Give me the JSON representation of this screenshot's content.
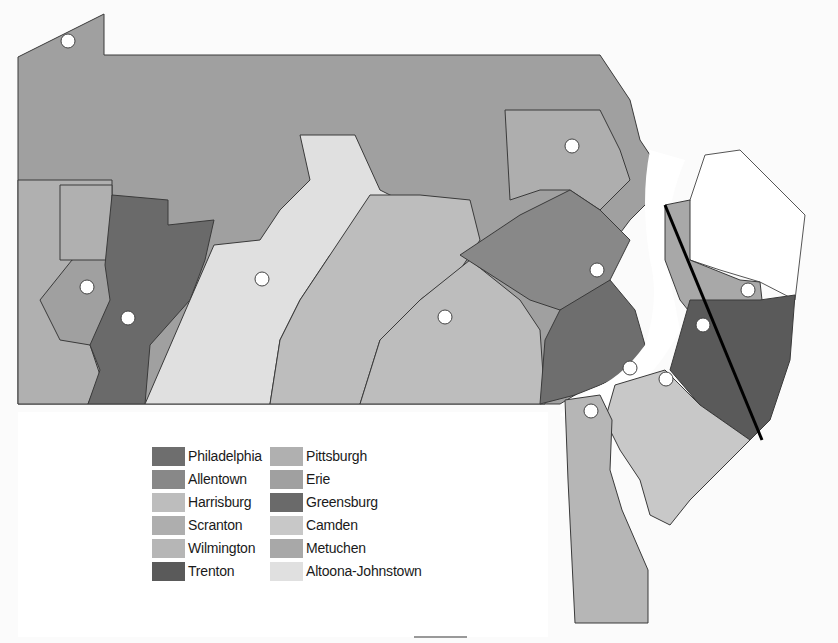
{
  "map": {
    "regions_shown": [
      "Pennsylvania",
      "New Jersey",
      "Delaware"
    ],
    "line_color": "#000000",
    "office_markers_count": 13
  },
  "legend": {
    "items": [
      {
        "label": "Philadelphia",
        "color": "#6e6e6e"
      },
      {
        "label": "Allentown",
        "color": "#888888"
      },
      {
        "label": "Harrisburg",
        "color": "#bdbdbd"
      },
      {
        "label": "Scranton",
        "color": "#aeaeae"
      },
      {
        "label": "Wilmington",
        "color": "#b6b6b6"
      },
      {
        "label": "Trenton",
        "color": "#5a5a5a"
      },
      {
        "label": "Pittsburgh",
        "color": "#b0b0b0"
      },
      {
        "label": "Erie",
        "color": "#a0a0a0"
      },
      {
        "label": "Greensburg",
        "color": "#6a6a6a"
      },
      {
        "label": "Camden",
        "color": "#c8c8c8"
      },
      {
        "label": "Metuchen",
        "color": "#a8a8a8"
      },
      {
        "label": "Altoona-Johnstown",
        "color": "#e0e0e0"
      }
    ]
  }
}
